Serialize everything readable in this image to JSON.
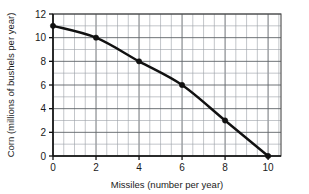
{
  "chart_data": {
    "type": "line",
    "title": "",
    "subtitle": "",
    "xlabel": "Missiles (number per year)",
    "ylabel": "Corn (millions of bushels per year)",
    "xlim": [
      0,
      10.6
    ],
    "ylim": [
      0,
      12
    ],
    "x_ticks": [
      0,
      2,
      4,
      6,
      8,
      10
    ],
    "x_tick_labels": [
      "0",
      "2",
      "4",
      "6",
      "8",
      "10"
    ],
    "y_ticks": [
      0,
      2,
      4,
      6,
      8,
      10,
      12
    ],
    "y_tick_labels": [
      "0",
      "2",
      "4",
      "6",
      "8",
      "10",
      "12"
    ],
    "grid": true,
    "grid_x_step": 0.5,
    "grid_y_step": 1,
    "legend": "none",
    "marker": "circle",
    "line_color": "#111111",
    "marker_color": "#111111",
    "grid_color": "#9aa0a6",
    "x": [
      0,
      2,
      4,
      6,
      8,
      10
    ],
    "values": [
      11,
      10,
      8,
      6,
      3,
      0
    ],
    "points": [
      {
        "x": 0,
        "y": 11
      },
      {
        "x": 2,
        "y": 10
      },
      {
        "x": 4,
        "y": 8
      },
      {
        "x": 6,
        "y": 6
      },
      {
        "x": 8,
        "y": 3
      },
      {
        "x": 10,
        "y": 0
      }
    ],
    "annotations": []
  },
  "axes": {
    "x_title": "Missiles (number per year)",
    "y_title": "Corn (millions of bushels per year)"
  },
  "x_tick_labels": {
    "0": "0",
    "1": "2",
    "2": "4",
    "3": "6",
    "4": "8",
    "5": "10"
  },
  "y_tick_labels": {
    "0": "0",
    "1": "2",
    "2": "4",
    "3": "6",
    "4": "8",
    "5": "10",
    "6": "12"
  }
}
